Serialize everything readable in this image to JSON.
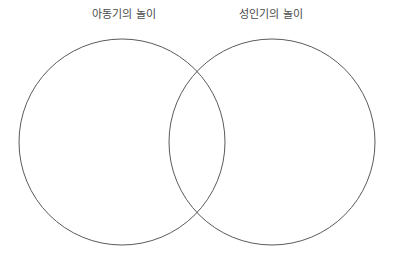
{
  "diagram": {
    "type": "venn-two-circle",
    "background_color": "#ffffff",
    "labels": {
      "left": "아동기의 놀이",
      "right": "성인기의 놀이"
    },
    "label_color": "#4a4a4a",
    "circles": [
      {
        "name": "left-circle",
        "label": "아동기의 놀이",
        "cx": 122,
        "cy": 142,
        "r": 103,
        "stroke_color": "#5a5a5a",
        "stroke_width": 1,
        "fill": "none"
      },
      {
        "name": "right-circle",
        "label": "성인기의 놀이",
        "cx": 272,
        "cy": 142,
        "r": 103,
        "stroke_color": "#5a5a5a",
        "stroke_width": 1,
        "fill": "none"
      }
    ],
    "intersection_points": [
      {
        "x": 197,
        "y": 71
      },
      {
        "x": 197,
        "y": 213
      }
    ]
  }
}
